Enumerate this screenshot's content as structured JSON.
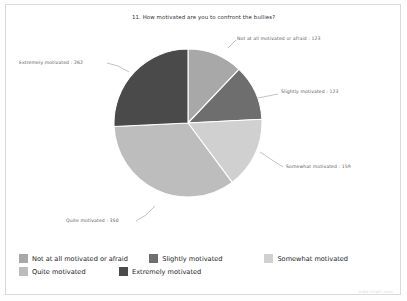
{
  "chart_data": {
    "type": "pie",
    "title": "11. How motivated are you to confront the bullies?",
    "categories": [
      "Not at all motivated or afraid",
      "Slightly motivated",
      "Somewhat motivated",
      "Quite motivated",
      "Extremely motivated"
    ],
    "values": [
      123,
      123,
      159,
      350,
      262
    ],
    "total": 1017,
    "colors": [
      "#a8a8a8",
      "#6e6e6e",
      "#d0d0d0",
      "#bdbdbd",
      "#4a4a4a"
    ],
    "start_angle_deg": 0,
    "direction": "clockwise",
    "legend_position": "bottom",
    "grid": false,
    "xlabel": "",
    "ylabel": "",
    "slice_labels": [
      "Not at all motivated or afraid : 123",
      "Slightly motivated : 123",
      "Somewhat motivated : 159",
      "Quite motivated : 350",
      "Extremely motivated : 262"
    ]
  },
  "legend": {
    "row1": [
      {
        "label": "Not at all motivated or afraid",
        "color": "#a8a8a8"
      },
      {
        "label": "Slightly motivated",
        "color": "#6e6e6e"
      },
      {
        "label": "Somewhat motivated",
        "color": "#d0d0d0"
      }
    ],
    "row2": [
      {
        "label": "Quite motivated",
        "color": "#bdbdbd"
      },
      {
        "label": "Extremely motivated",
        "color": "#4a4a4a"
      }
    ]
  },
  "watermark": "mdu-chart.com"
}
